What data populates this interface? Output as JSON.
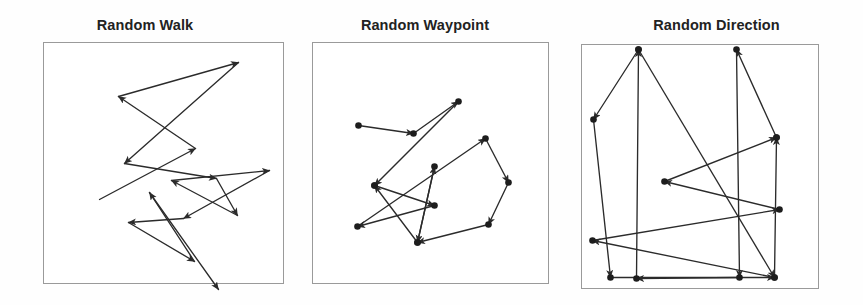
{
  "figure": {
    "background_color": "#fefefe",
    "width": 863,
    "height": 305,
    "line_color": "#2b2b2b",
    "frame_color": "#9a9a9a",
    "node_color": "#1d1d1d"
  },
  "panels": [
    {
      "id": "random-walk",
      "title": "Random Walk",
      "frame": {
        "x": 43,
        "y": 42,
        "w": 240,
        "h": 241
      },
      "shows_nodes": false,
      "shows_arrows": true
    },
    {
      "id": "random-waypoint",
      "title": "Random Waypoint",
      "frame": {
        "x": 312,
        "y": 42,
        "w": 236,
        "h": 241
      },
      "shows_nodes": true,
      "shows_arrows": true
    },
    {
      "id": "random-direction",
      "title": "Random Direction",
      "frame": {
        "x": 581,
        "y": 44,
        "w": 237,
        "h": 244
      },
      "shows_nodes": true,
      "shows_arrows": true
    }
  ],
  "chart_data": {
    "type": "line",
    "subtitle": "",
    "xlabel": "",
    "ylabel": "",
    "grid": false,
    "legend_position": "none",
    "note": "Three mobility-model trajectory diagrams drawn in local panel pixel coordinates; each series is an ordered polyline of movement segments with arrowheads showing travel direction.",
    "series": [
      {
        "name": "Random Walk",
        "panel": "random-walk",
        "axis_range": {
          "xlim": [
            0,
            240
          ],
          "ylim": [
            0,
            241
          ]
        },
        "markers": false,
        "points": [
          [
            56,
            157
          ],
          [
            152,
            106
          ],
          [
            75,
            54
          ],
          [
            195,
            20
          ],
          [
            81,
            121
          ],
          [
            173,
            136
          ],
          [
            194,
            173
          ],
          [
            128,
            138
          ],
          [
            226,
            128
          ],
          [
            140,
            176
          ],
          [
            85,
            180
          ],
          [
            151,
            219
          ],
          [
            106,
            150
          ],
          [
            175,
            247
          ]
        ]
      },
      {
        "name": "Random Waypoint",
        "panel": "random-waypoint",
        "axis_range": {
          "xlim": [
            0,
            236
          ],
          "ylim": [
            0,
            241
          ]
        },
        "markers": true,
        "points": [
          [
            46,
            83
          ],
          [
            101,
            91
          ],
          [
            146,
            59
          ],
          [
            62,
            143
          ],
          [
            122,
            163
          ],
          [
            45,
            184
          ],
          [
            173,
            96
          ],
          [
            196,
            140
          ],
          [
            176,
            182
          ],
          [
            105,
            200
          ],
          [
            122,
            124
          ],
          [
            105,
            200
          ],
          [
            62,
            143
          ]
        ]
      },
      {
        "name": "Random Direction",
        "panel": "random-direction",
        "axis_range": {
          "xlim": [
            0,
            237
          ],
          "ylim": [
            0,
            244
          ]
        },
        "markers": true,
        "points": [
          [
            57,
            5
          ],
          [
            12,
            75
          ],
          [
            29,
            233
          ],
          [
            193,
            233
          ],
          [
            11,
            196
          ],
          [
            198,
            165
          ],
          [
            83,
            137
          ],
          [
            195,
            93
          ],
          [
            155,
            5
          ],
          [
            158,
            233
          ],
          [
            55,
            234
          ],
          [
            57,
            5
          ],
          [
            193,
            233
          ],
          [
            195,
            93
          ]
        ]
      }
    ]
  }
}
